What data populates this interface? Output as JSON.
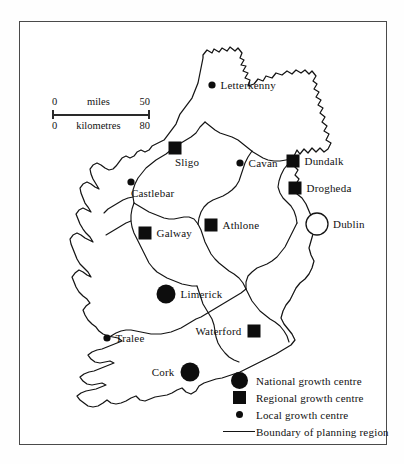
{
  "map": {
    "title": "Ireland planning regions and growth centres",
    "frame": {
      "x": 19,
      "y": 21,
      "width": 368,
      "height": 424,
      "border_color": "#4a4a4a"
    },
    "background_color": "#ffffff",
    "ink_color": "#141414"
  },
  "scale": {
    "miles": {
      "start": "0",
      "label": "miles",
      "end": "50"
    },
    "kilometres": {
      "start": "0",
      "label": "kilometres",
      "end": "80"
    }
  },
  "places": [
    {
      "name": "Letterkenny",
      "type": "local",
      "x": 212,
      "y": 85,
      "label_side": "right"
    },
    {
      "name": "Sligo",
      "type": "regional",
      "x": 175,
      "y": 148,
      "label_side": "below"
    },
    {
      "name": "Cavan",
      "type": "local",
      "x": 240,
      "y": 163,
      "label_side": "right"
    },
    {
      "name": "Dundalk",
      "type": "regional",
      "x": 293,
      "y": 161,
      "label_side": "right"
    },
    {
      "name": "Drogheda",
      "type": "regional",
      "x": 295,
      "y": 188,
      "label_side": "right"
    },
    {
      "name": "Castlebar",
      "type": "local",
      "x": 131,
      "y": 182,
      "label_side": "below"
    },
    {
      "name": "Dublin",
      "type": "capital",
      "x": 317,
      "y": 224,
      "label_side": "right"
    },
    {
      "name": "Athlone",
      "type": "regional",
      "x": 211,
      "y": 225,
      "label_side": "right"
    },
    {
      "name": "Galway",
      "type": "regional",
      "x": 145,
      "y": 233,
      "label_side": "right"
    },
    {
      "name": "Limerick",
      "type": "national",
      "x": 166,
      "y": 294,
      "label_side": "right"
    },
    {
      "name": "Waterford",
      "type": "regional",
      "x": 254,
      "y": 331,
      "label_side": "left"
    },
    {
      "name": "Tralee",
      "type": "local",
      "x": 107,
      "y": 338,
      "label_side": "right"
    },
    {
      "name": "Cork",
      "type": "national",
      "x": 190,
      "y": 372,
      "label_side": "left"
    }
  ],
  "legend": {
    "items": [
      {
        "symbol": "national-growth-centre-symbol",
        "label": "National growth centre"
      },
      {
        "symbol": "regional-growth-centre-symbol",
        "label": "Regional growth centre"
      },
      {
        "symbol": "local-growth-centre-symbol",
        "label": "Local growth centre"
      },
      {
        "symbol": "boundary-line-symbol",
        "label": "Boundary of planning region"
      }
    ]
  }
}
